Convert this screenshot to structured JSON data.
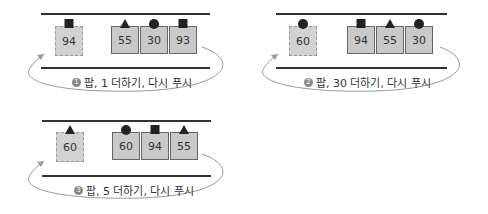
{
  "panels": [
    {
      "step": "1",
      "caption": "팝, 1 더하기, 다시 푸시",
      "popped": {
        "value": "94",
        "shape": "square"
      },
      "stack": [
        {
          "value": "55",
          "shape": "triangle"
        },
        {
          "value": "30",
          "shape": "circle"
        },
        {
          "value": "93",
          "shape": "square"
        }
      ]
    },
    {
      "step": "2",
      "caption": "팝, 30 더하기, 다시 푸시",
      "popped": {
        "value": "60",
        "shape": "circle"
      },
      "stack": [
        {
          "value": "94",
          "shape": "square"
        },
        {
          "value": "55",
          "shape": "triangle"
        },
        {
          "value": "30",
          "shape": "circle"
        }
      ]
    },
    {
      "step": "3",
      "caption": "팝, 5 더하기, 다시 푸시",
      "popped": {
        "value": "60",
        "shape": "triangle"
      },
      "stack": [
        {
          "value": "60",
          "shape": "circle"
        },
        {
          "value": "94",
          "shape": "square"
        },
        {
          "value": "55",
          "shape": "triangle"
        }
      ]
    }
  ],
  "colors": {
    "box_fill": "#c9c9c9",
    "line": "#333333",
    "arc": "#999999"
  }
}
